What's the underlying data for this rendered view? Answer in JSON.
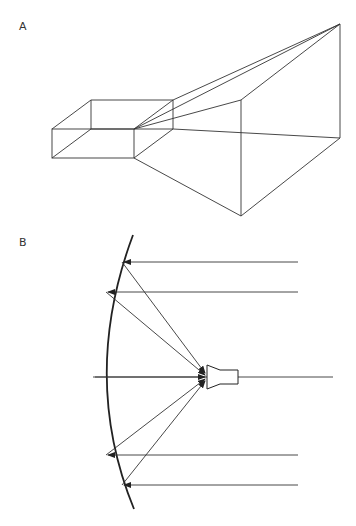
{
  "panels": [
    {
      "label": "A",
      "description": "Pyramidal horn antenna attached to rectangular waveguide"
    },
    {
      "label": "B",
      "description": "Parabolic reflector with feed horn; parallel incoming rays reflected to focal point"
    }
  ],
  "colors": {
    "stroke": "#333333",
    "background": "#ffffff"
  }
}
